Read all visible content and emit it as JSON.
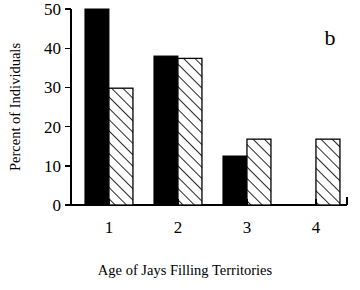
{
  "chart_data": {
    "type": "bar",
    "title": "",
    "panel_label": "b",
    "xlabel": "Age of Jays Filling Territories",
    "ylabel": "Percent of Individuals",
    "categories": [
      "1",
      "2",
      "3",
      "4"
    ],
    "xtick_labels": [
      "1",
      "2",
      "3",
      "4"
    ],
    "ytick_labels": [
      "0",
      "10",
      "20",
      "30",
      "40",
      "50"
    ],
    "ytick_values": [
      0,
      10,
      20,
      30,
      40,
      50
    ],
    "ylim": [
      0,
      50
    ],
    "grid": false,
    "legend": "none",
    "series": [
      {
        "name": "solid",
        "fill": "solid-black",
        "color": "#000000",
        "values": [
          50,
          38,
          12.5,
          0
        ]
      },
      {
        "name": "hatched",
        "fill": "diagonal-hatch",
        "color": "#ffffff",
        "values": [
          29.8,
          37.4,
          16.8,
          16.8
        ]
      }
    ]
  },
  "figure": {
    "axis_color": "#000000",
    "background": "#ffffff"
  }
}
